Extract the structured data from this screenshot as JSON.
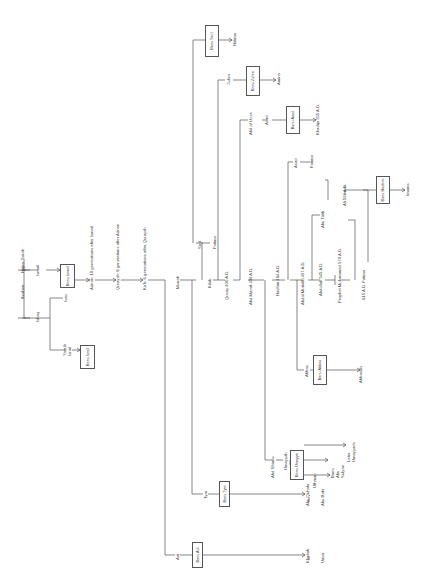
{
  "diagram": {
    "orientation": "rotated 90 degrees clockwise",
    "nodes": {
      "sarah": "Sarah",
      "ibrahim": "Ibrahim",
      "hajira": "Hajira",
      "ishaq": "Ishaq",
      "ismail": "Ismail",
      "isau": "Isau",
      "yaqub": "Yaqub Israil",
      "banu_israil": "Banu Israil",
      "banu_ismail": "Banu Ismail",
      "adnan": "Adnan: 10 generations after Ismail",
      "quraysh": "Quraysh: 8 generations after Adnan",
      "kab": "Ka'b: 6 generations after Quraysh",
      "murrah": "Murrah",
      "adi": "Adi",
      "taym": "Tym",
      "said": "Sa'd",
      "fatima1": "Fatima",
      "kilab": "Kilab",
      "qusay": "Qusay 400 A.D.",
      "zuhra": "Zuhra",
      "abd_manaf": "Abd Manaf 430 A.D.",
      "abd_al_uzza": "Abd al Uzza",
      "asad1": "Asad",
      "abd_shams": "Abd Shams",
      "hashim": "Hashim 464 A.D.",
      "umayyah": "Umayyah",
      "abdal_muttalib": "Abdal Muttalib 497 A.D.",
      "asad2": "Asad",
      "fatima2": "Fatima",
      "abbas": "Abbas",
      "abdullah": "Abdullah 545 A.D.",
      "abu_talib": "Abu Talib",
      "prophet": "Prophet Muhammad 570 A.D.",
      "ali": "Ali 599 A.D.",
      "fatima3": "615 A.D. Fatima",
      "khadija": "Khadija 555 A.D.",
      "amina": "Amina",
      "halima": "Halima",
      "imams": "Imams",
      "abbasids": "Abbasids",
      "uthman": "Uthman",
      "banu_abu_sufyan": "Banu Abu Sufyan",
      "later_umayyads": "Later Umayyads",
      "abu_quhafa": "Abu Quhafa",
      "abu_bakr": "Abu Bakr",
      "khattab": "Khattab",
      "umar": "Umar"
    },
    "boxes": {
      "banu_israil": "Banu Israil",
      "banu_ismail": "Banu Ismail",
      "banu_sad": "Banu Sa'd",
      "banu_zuhra": "Banu Zuhra",
      "banu_asad": "Banu Asad",
      "banu_hashim": "Banu Hashim",
      "banu_abbas": "Banu Abbas",
      "banu_umayya": "Banu Umayya",
      "banu_taym": "Banu Tym",
      "banu_adi": "Banu Adi"
    }
  }
}
